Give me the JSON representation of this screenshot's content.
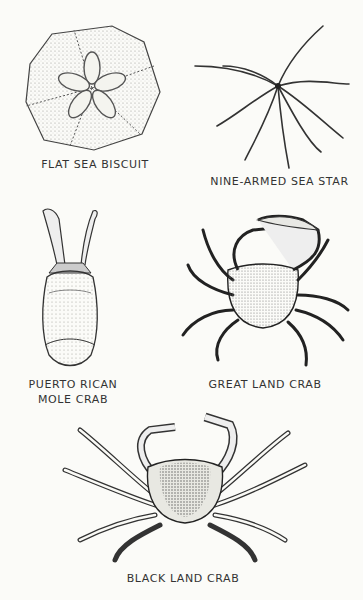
{
  "figures": [
    {
      "id": "flat-sea-biscuit",
      "label": "FLAT SEA BISCUIT"
    },
    {
      "id": "nine-armed-sea-star",
      "label": "NINE-ARMED SEA STAR"
    },
    {
      "id": "puerto-rican-mole-crab",
      "label_line1": "PUERTO RICAN",
      "label_line2": "MOLE CRAB"
    },
    {
      "id": "great-land-crab",
      "label": "GREAT LAND CRAB"
    },
    {
      "id": "black-land-crab",
      "label": "BLACK LAND CRAB"
    }
  ],
  "colors": {
    "background": "#fbfbf8",
    "ink": "#2a2a2a",
    "stipple": "#bdbdb6"
  }
}
